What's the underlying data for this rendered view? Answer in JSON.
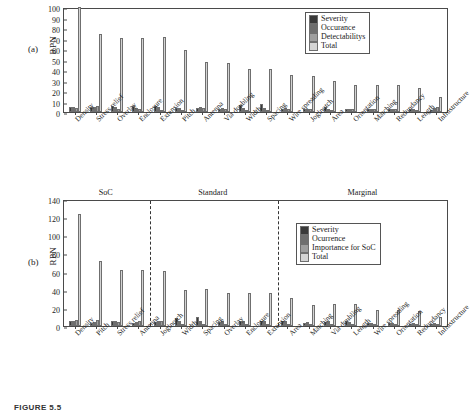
{
  "figure": {
    "caption": "FIGURE 5.5",
    "panel_a_label": "(a)",
    "panel_b_label": "(b)"
  },
  "colors": {
    "severity": "#3a3a3a",
    "occurance": "#6e6e6e",
    "detectability": "#9e9e9e",
    "total": "#d4d4d4",
    "axis": "#4a4a4a",
    "text": "#1a1a1a"
  },
  "chart_data": [
    {
      "type": "bar",
      "panel": "(a)",
      "title": "",
      "xlabel": "",
      "ylabel": "RPN",
      "ylim": [
        0,
        100
      ],
      "yticks": [
        0,
        10,
        20,
        30,
        40,
        50,
        60,
        70,
        80,
        90,
        100
      ],
      "grid": false,
      "legend_position": "top-right",
      "categories": [
        "Density",
        "Stress relief",
        "Overlay",
        "Enclosure",
        "Extension",
        "Pitch",
        "Antenna",
        "Via doubling",
        "Width",
        "Spacing",
        "Wire spreading",
        "Joglnotch",
        "Area",
        "Orientation",
        "Matching",
        "Redundancy",
        "Length",
        "Infrastructure"
      ],
      "series": [
        {
          "name": "Severity",
          "color": "#3a3a3a",
          "values": [
            5,
            5,
            6,
            6,
            6,
            4,
            4,
            3,
            7,
            7.5,
            3,
            3,
            4.5,
            3,
            3,
            3,
            3,
            2
          ]
        },
        {
          "name": "Occurance",
          "color": "#6e6e6e",
          "values": [
            5,
            5,
            4.5,
            4,
            5,
            4,
            4.5,
            3.5,
            4,
            4,
            3.5,
            3,
            3,
            3,
            3,
            3,
            3,
            4
          ]
        },
        {
          "name": "Detectabilitys",
          "color": "#9e9e9e",
          "values": [
            4,
            6,
            2.5,
            2.5,
            2,
            2,
            4,
            3,
            1.5,
            1,
            3,
            3,
            1.5,
            2.5,
            2.5,
            2.5,
            1.5,
            4.5
          ]
        },
        {
          "name": "Total",
          "color": "#d4d4d4",
          "values": [
            100,
            74.5,
            70.5,
            70.5,
            71,
            59.5,
            48,
            46.5,
            40.5,
            41,
            35.5,
            34.5,
            29.5,
            26,
            26,
            26,
            22.5,
            14
          ]
        }
      ]
    },
    {
      "type": "bar",
      "panel": "(b)",
      "title": "",
      "xlabel": "",
      "ylabel": "RPN",
      "ylim": [
        0,
        140
      ],
      "yticks": [
        0,
        20,
        40,
        60,
        80,
        100,
        120,
        140
      ],
      "grid": false,
      "legend_position": "top-right",
      "regions": [
        {
          "label": "SoC",
          "start_index": 0,
          "end_index": 4
        },
        {
          "label": "Standard",
          "start_index": 4,
          "end_index": 10
        },
        {
          "label": "Marginal",
          "start_index": 10,
          "end_index": 18
        }
      ],
      "categories": [
        "Density",
        "Pitch",
        "Stress relief",
        "Antenna",
        "Joglnotch",
        "Width",
        "Spacing",
        "Overlay",
        "Enclosure",
        "Extension",
        "Area",
        "Matching",
        "Via doubling",
        "Length",
        "Wire spreading",
        "Orientation",
        "Redundancy",
        "Infrastructure"
      ],
      "series": [
        {
          "name": "Severity",
          "color": "#3a3a3a",
          "values": [
            6,
            3,
            6,
            3.5,
            4,
            9,
            9.5,
            4,
            6,
            6,
            6,
            3,
            4,
            5,
            3,
            3.5,
            2,
            2
          ]
        },
        {
          "name": "Ocurrence",
          "color": "#6e6e6e",
          "values": [
            6,
            4,
            5,
            4.5,
            5.5,
            5,
            5.5,
            5.5,
            5.5,
            5,
            5,
            4.5,
            5,
            4,
            3.5,
            3,
            3,
            3
          ]
        },
        {
          "name": "Importance for SoC",
          "color": "#9e9e9e",
          "values": [
            6.5,
            6.5,
            4.5,
            6,
            6,
            1.5,
            1.5,
            1.5,
            1.5,
            1.5,
            2,
            2,
            2,
            2,
            2,
            2,
            2,
            2
          ]
        },
        {
          "name": "Total",
          "color": "#d4d4d4",
          "values": [
            124,
            72,
            62,
            62,
            61,
            40,
            41,
            36,
            36.5,
            36,
            31,
            23,
            24,
            24,
            18,
            18,
            17,
            9.5
          ]
        }
      ]
    }
  ]
}
